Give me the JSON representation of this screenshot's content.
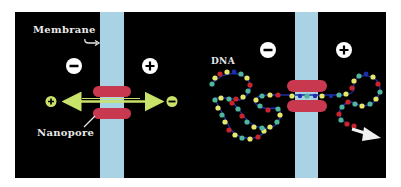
{
  "figure": {
    "colors": {
      "background": "#ffffff",
      "panel": "#000000",
      "membrane": "#a9d2e4",
      "pore": "#c8384f",
      "arrow_green": "#c9e26a",
      "charge_circle": "#ffffff",
      "charge_sign": "#000000",
      "label": "#e8e8e8",
      "bead_yellow": "#e6e86a",
      "bead_teal": "#4fb59c",
      "bead_red": "#c8242c",
      "backbone_blue": "#1d2fa8"
    },
    "left_panel": {
      "labels": {
        "membrane": "Membrane",
        "nanopore": "Nanopore"
      },
      "charges": {
        "left": "−",
        "right": "+"
      },
      "arrow_ends": {
        "left": "+",
        "right": "−"
      }
    },
    "right_panel": {
      "labels": {
        "dna": "DNA"
      },
      "charges": {
        "left": "−",
        "right": "+"
      },
      "exit_arrow": "white-arrow"
    }
  },
  "dna_strand": {
    "left_path": "M260,96 L245,96 L230,98 L212,96 L200,95 L186,96 L172,100 L165,108 L160,118 L162,128 L170,136 L182,138 L196,136 L208,132 L212,124 L210,114 L216,106 L228,110 L236,118 L230,126 L220,130 L210,132 M200,95 L190,90 L178,84 L168,76 L158,72 L146,72 L140,80 L144,88 L150,90",
    "right_path": "M318,96 L330,96 L340,96 L352,92 L362,84 L372,78 L380,84 L382,94 L378,104 L368,108 L356,106 L350,98 L348,90 L354,82 M340,96 L338,106 L336,116 L342,124 L352,126"
  }
}
